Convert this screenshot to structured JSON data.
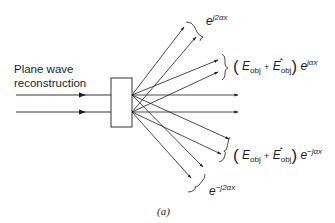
{
  "figure": {
    "input_label_line1": "Plane wave",
    "input_label_line2": "reconstruction",
    "caption": "(a)",
    "colors": {
      "line": "#1e1e1e",
      "background": "#ffffff"
    }
  },
  "orders": {
    "plus_two": {
      "base": "e",
      "exponent": "j2αx"
    },
    "plus_one": {
      "open": "(",
      "E1": "E",
      "sub1": "obj",
      "plus": "+",
      "E2": "E",
      "sup2": "*",
      "sub2": "obj",
      "close": ")",
      "base": "e",
      "exponent": "jαx"
    },
    "minus_one": {
      "open": "(",
      "E1": "E",
      "sub1": "obj",
      "plus": "+",
      "E2": "E",
      "sup2": "*",
      "sub2": "obj",
      "close": ")",
      "base": "e",
      "exponent": "−jαx"
    },
    "minus_two": {
      "base": "e",
      "exponent": "−j2αx"
    }
  }
}
